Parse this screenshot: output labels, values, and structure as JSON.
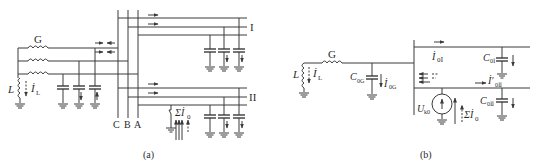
{
  "figure": {
    "panel_a": {
      "caption": "(a)",
      "generator_label": "G",
      "inductor_label": "L",
      "inductor_current_label": "İ",
      "inductor_current_sub": "L",
      "bus_labels": [
        "C",
        "B",
        "A"
      ],
      "line_labels": [
        "I",
        "II"
      ],
      "fault_current_label": "Σİ",
      "fault_current_sub": "0"
    },
    "panel_b": {
      "caption": "(b)",
      "generator_label": "G",
      "inductor_label": "L",
      "inductor_current_label": "İ",
      "inductor_current_sub": "L",
      "gen_cap_label": "C",
      "gen_cap_sub": "0G",
      "gen_cap_current": "İ",
      "gen_cap_current_sub": "0G",
      "line1_current": "İ",
      "line1_current_sub": "0Ⅰ",
      "line1_cap": "C",
      "line1_cap_sub": "0Ⅰ",
      "line2_current": "İ′",
      "line2_current_sub": "0Ⅱ",
      "line2_cap": "C",
      "line2_cap_sub": "0Ⅱ",
      "source_label": "U",
      "source_sub": "k0",
      "sum_current": "Σİ",
      "sum_current_sub": "0"
    },
    "colors": {
      "line": "#3a3a3a",
      "text": "#2a2a2a",
      "background": "#ffffff"
    }
  }
}
